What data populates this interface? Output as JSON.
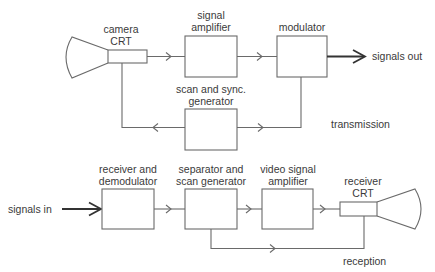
{
  "diagram": {
    "type": "block-diagram",
    "colors": {
      "stroke": "#6a6a6a",
      "text": "#3a3a3a",
      "background": "#ffffff"
    },
    "transmission": {
      "section_label": "transmission",
      "camera_crt": {
        "line1": "camera",
        "line2": "CRT"
      },
      "signal_amplifier": {
        "line1": "signal",
        "line2": "amplifier"
      },
      "modulator": {
        "line1": "modulator"
      },
      "scan_sync_generator": {
        "line1": "scan and sync.",
        "line2": "generator"
      },
      "output_label": "signals out"
    },
    "reception": {
      "section_label": "reception",
      "input_label": "signals in",
      "receiver_demodulator": {
        "line1": "receiver and",
        "line2": "demodulator"
      },
      "separator_scan_generator": {
        "line1": "separator and",
        "line2": "scan generator"
      },
      "video_signal_amplifier": {
        "line1": "video signal",
        "line2": "amplifier"
      },
      "receiver_crt": {
        "line1": "receiver",
        "line2": "CRT"
      }
    }
  }
}
